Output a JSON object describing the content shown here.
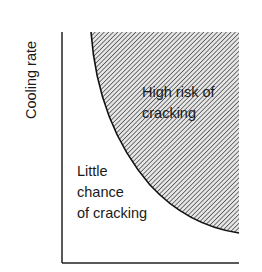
{
  "diagram": {
    "y_axis_label": "Cooling rate",
    "x_axis_label": "",
    "regions": {
      "high": {
        "lines": [
          "High risk of",
          "cracking"
        ],
        "fill": "hatched",
        "hatch_color": "#555555"
      },
      "low": {
        "lines": [
          "Little",
          "chance",
          "of cracking"
        ]
      }
    },
    "colors": {
      "axis": "#222222",
      "curve": "#111111",
      "background": "#ffffff"
    }
  }
}
